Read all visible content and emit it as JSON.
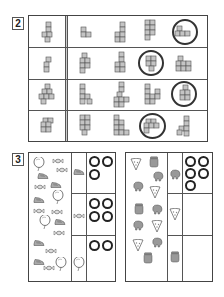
{
  "exercise_2": {
    "label": "2",
    "rows": [
      {
        "reference": "cube-figure",
        "options": [
          "cube-figure-a",
          "cube-figure-b",
          "cube-figure-c",
          "cube-figure-d"
        ],
        "circled_index": 3
      },
      {
        "reference": "cube-figure",
        "options": [
          "cube-figure-a",
          "cube-figure-b",
          "cube-figure-c",
          "cube-figure-d"
        ],
        "circled_index": 2
      },
      {
        "reference": "cube-figure",
        "options": [
          "cube-figure-a",
          "cube-figure-b",
          "cube-figure-c",
          "cube-figure-d"
        ],
        "circled_index": 3
      },
      {
        "reference": "cube-figure",
        "options": [
          "cube-figure-a",
          "cube-figure-b",
          "cube-figure-c",
          "cube-figure-d"
        ],
        "circled_index": 2
      }
    ]
  },
  "exercise_3": {
    "label": "3",
    "left_panel": {
      "scattered_items": [
        "balloon",
        "candy",
        "sneaker"
      ],
      "rows": [
        {
          "item": "sneaker",
          "rings": 3
        },
        {
          "item": "candy",
          "rings": 4
        },
        {
          "item": "balloon",
          "rings": 2
        }
      ]
    },
    "right_panel": {
      "scattered_items": [
        "pizza-slice",
        "elephant",
        "jar"
      ],
      "rows": [
        {
          "item": "elephant",
          "rings": 5
        },
        {
          "item": "pizza-slice",
          "rings": 0
        },
        {
          "item": "jar",
          "rings": 0
        }
      ]
    }
  },
  "colors": {
    "border": "#444444",
    "cube_fill": "#bdbdbd",
    "ring": "#222222"
  }
}
